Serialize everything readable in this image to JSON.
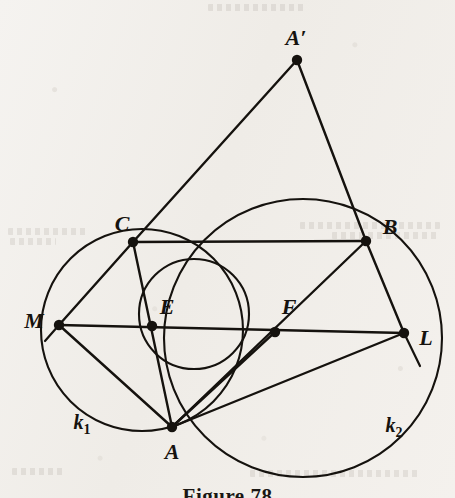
{
  "figure": {
    "caption": "Figure 78",
    "background_color": "#f3f1ee",
    "ink_color": "#15120e"
  },
  "labels": {
    "a_prime": "A′",
    "c": "C",
    "b": "B",
    "m": "M",
    "e": "E",
    "f": "F",
    "l": "L",
    "a": "A",
    "k1": "k",
    "k1_sub": "1",
    "k2": "k",
    "k2_sub": "2"
  },
  "ghost_text": {
    "note": "faint show-through text from the reverse page",
    "lines": [
      {
        "x": 8,
        "y": 228,
        "w": 78
      },
      {
        "x": 300,
        "y": 222,
        "w": 140
      },
      {
        "x": 10,
        "y": 238,
        "w": 46
      },
      {
        "x": 332,
        "y": 232,
        "w": 108
      },
      {
        "x": 12,
        "y": 468,
        "w": 52
      },
      {
        "x": 250,
        "y": 470,
        "w": 170
      },
      {
        "x": 208,
        "y": 4,
        "w": 96
      }
    ]
  },
  "chart_data": {
    "type": "diagram",
    "title": "Figure 78",
    "subtype": "euclidean-geometry-construction",
    "coordinate_space": {
      "width": 455,
      "height": 498,
      "origin": "top-left"
    },
    "points": [
      {
        "name": "A'",
        "x": 297,
        "y": 60,
        "label": "A′",
        "label_x": 296,
        "label_y": 38,
        "label_anchor": "middle",
        "dot": true
      },
      {
        "name": "C",
        "x": 133,
        "y": 242,
        "label": "C",
        "label_x": 122,
        "label_y": 224,
        "label_anchor": "middle",
        "dot": true
      },
      {
        "name": "B",
        "x": 366,
        "y": 241,
        "label": "B",
        "label_x": 390,
        "label_y": 227,
        "label_anchor": "middle",
        "dot": true
      },
      {
        "name": "M",
        "x": 59,
        "y": 325,
        "label": "M",
        "label_x": 34,
        "label_y": 321,
        "label_anchor": "middle",
        "dot": true
      },
      {
        "name": "E",
        "x": 152,
        "y": 326,
        "label": "E",
        "label_x": 167,
        "label_y": 307,
        "label_anchor": "middle",
        "dot": true
      },
      {
        "name": "F",
        "x": 275,
        "y": 332,
        "label": "F",
        "label_x": 289,
        "label_y": 307,
        "label_anchor": "middle",
        "dot": true
      },
      {
        "name": "L",
        "x": 404,
        "y": 333,
        "label": "L",
        "label_x": 426,
        "label_y": 338,
        "label_anchor": "middle",
        "dot": true
      },
      {
        "name": "A",
        "x": 172,
        "y": 427,
        "label": "A",
        "label_x": 172,
        "label_y": 452,
        "label_anchor": "middle",
        "dot": true
      }
    ],
    "circles": [
      {
        "name": "k1",
        "cx": 142,
        "cy": 330,
        "r": 101,
        "label": "k₁",
        "label_x": 82,
        "label_y": 424,
        "passes_through": [
          "M",
          "C",
          "A"
        ]
      },
      {
        "name": "middle-circle",
        "cx": 194,
        "cy": 314,
        "r": 55,
        "label": "",
        "passes_through": [
          "C",
          "A",
          "F"
        ]
      },
      {
        "name": "k2",
        "cx": 303,
        "cy": 338,
        "r": 139,
        "label": "k₂",
        "label_x": 394,
        "label_y": 427,
        "passes_through": [
          "A",
          "B",
          "L"
        ]
      }
    ],
    "segments": [
      {
        "from": "A'",
        "to": "C",
        "name": "A'C"
      },
      {
        "from": "A'",
        "to": "B",
        "name": "A'B"
      },
      {
        "from": "C",
        "to": "B",
        "name": "CB"
      },
      {
        "from": "C",
        "to": "M",
        "name": "CM"
      },
      {
        "from": "C",
        "to": "A",
        "name": "CA"
      },
      {
        "from": "M",
        "to": "L",
        "name": "ML"
      },
      {
        "from": "M",
        "to": "A",
        "name": "MA"
      },
      {
        "from": "A",
        "to": "B",
        "name": "AB"
      },
      {
        "from": "A",
        "to": "L",
        "name": "AL"
      },
      {
        "from": "A",
        "to": "F",
        "name": "AF"
      },
      {
        "from": "B",
        "to": "L",
        "name": "BL"
      }
    ],
    "tangent_stubs": [
      {
        "at": "M",
        "x1": 59,
        "y1": 325,
        "x2": 45,
        "y2": 341,
        "name": "tangent-stub-M"
      },
      {
        "at": "L",
        "x1": 404,
        "y1": 333,
        "x2": 420,
        "y2": 366,
        "name": "tangent-stub-L"
      }
    ]
  }
}
